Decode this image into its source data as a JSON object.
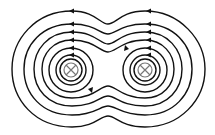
{
  "diagram": {
    "wires": [
      {
        "id": "left-wire",
        "cx": 71,
        "cy": 70,
        "symbol": "cross-into-page"
      },
      {
        "id": "right-wire",
        "cx": 145,
        "cy": 70,
        "symbol": "cross-into-page"
      }
    ],
    "stroke_color": "#111111",
    "symbol_color": "#777777",
    "arrow_direction": "left-on-top"
  }
}
